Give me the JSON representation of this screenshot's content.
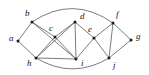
{
  "figure": {
    "kind": "undirected-graph-diagram",
    "width": 149,
    "height": 75,
    "background_color": "#ffffff",
    "edge_color": "#5a5a5a",
    "node_color": "#1a1a1a",
    "label_color": "#111111"
  },
  "graph_data": {
    "type": "graph",
    "directed": false,
    "node_count": 10,
    "edge_count": 19,
    "nodes": [
      {
        "id": "a",
        "label": "a",
        "x": 18,
        "y": 41,
        "label_x": 9,
        "label_y": 39
      },
      {
        "id": "b",
        "label": "b",
        "x": 32,
        "y": 22,
        "label_x": 25,
        "label_y": 14
      },
      {
        "id": "c",
        "label": "c",
        "x": 55,
        "y": 37,
        "label_x": 49,
        "label_y": 29
      },
      {
        "id": "d",
        "label": "d",
        "x": 75,
        "y": 22,
        "label_x": 80,
        "label_y": 17
      },
      {
        "id": "e",
        "label": "e",
        "x": 94,
        "y": 38,
        "label_x": 88,
        "label_y": 30
      },
      {
        "id": "f",
        "label": "f",
        "x": 113,
        "y": 23,
        "label_x": 116,
        "label_y": 15
      },
      {
        "id": "g",
        "label": "g",
        "x": 131,
        "y": 40,
        "label_x": 136,
        "label_y": 37
      },
      {
        "id": "h",
        "label": "h",
        "x": 36,
        "y": 58,
        "label_x": 27,
        "label_y": 64
      },
      {
        "id": "i",
        "label": "i",
        "x": 76,
        "y": 59,
        "label_x": 81,
        "label_y": 64
      },
      {
        "id": "j",
        "label": "j",
        "x": 109,
        "y": 58,
        "label_x": 113,
        "label_y": 66
      }
    ],
    "edges": [
      {
        "source": "a",
        "target": "b",
        "shape": "line"
      },
      {
        "source": "a",
        "target": "h",
        "shape": "line"
      },
      {
        "source": "b",
        "target": "c",
        "shape": "line"
      },
      {
        "source": "b",
        "target": "i",
        "shape": "line"
      },
      {
        "source": "b",
        "target": "f",
        "shape": "arc",
        "bow": -14
      },
      {
        "source": "c",
        "target": "d",
        "shape": "line"
      },
      {
        "source": "c",
        "target": "h",
        "shape": "line"
      },
      {
        "source": "c",
        "target": "i",
        "shape": "line"
      },
      {
        "source": "d",
        "target": "e",
        "shape": "line"
      },
      {
        "source": "d",
        "target": "h",
        "shape": "line"
      },
      {
        "source": "d",
        "target": "i",
        "shape": "line"
      },
      {
        "source": "e",
        "target": "f",
        "shape": "line"
      },
      {
        "source": "e",
        "target": "i",
        "shape": "line"
      },
      {
        "source": "e",
        "target": "j",
        "shape": "line"
      },
      {
        "source": "f",
        "target": "g",
        "shape": "line"
      },
      {
        "source": "f",
        "target": "j",
        "shape": "line"
      },
      {
        "source": "g",
        "target": "j",
        "shape": "line"
      },
      {
        "source": "h",
        "target": "i",
        "shape": "line"
      },
      {
        "source": "h",
        "target": "j",
        "shape": "arc",
        "bow": 11
      }
    ]
  }
}
